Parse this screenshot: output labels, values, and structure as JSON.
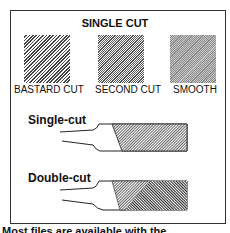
{
  "title": "SINGLE CUT",
  "swatches": [
    {
      "label": "BASTARD CUT"
    },
    {
      "label": "SECOND CUT"
    },
    {
      "label": "SMOOTH"
    }
  ],
  "files": [
    {
      "label": "Single-cut"
    },
    {
      "label": "Double-cut"
    }
  ],
  "caption": "Most files are available with the"
}
